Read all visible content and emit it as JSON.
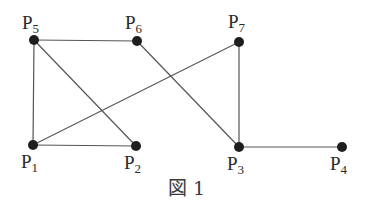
{
  "figure": {
    "caption": "図 1",
    "node_color": "#1e1e1e",
    "edge_color": "#555555"
  },
  "nodes": [
    {
      "id": "P1",
      "label": "P",
      "sub": "1",
      "x": 33,
      "y": 145
    },
    {
      "id": "P2",
      "label": "P",
      "sub": "2",
      "x": 136,
      "y": 146
    },
    {
      "id": "P3",
      "label": "P",
      "sub": "3",
      "x": 239,
      "y": 147
    },
    {
      "id": "P4",
      "label": "P",
      "sub": "4",
      "x": 342,
      "y": 147
    },
    {
      "id": "P5",
      "label": "P",
      "sub": "5",
      "x": 34,
      "y": 40
    },
    {
      "id": "P6",
      "label": "P",
      "sub": "6",
      "x": 137,
      "y": 41
    },
    {
      "id": "P7",
      "label": "P",
      "sub": "7",
      "x": 239,
      "y": 42
    }
  ],
  "edges": [
    [
      "P5",
      "P6"
    ],
    [
      "P5",
      "P1"
    ],
    [
      "P5",
      "P2"
    ],
    [
      "P1",
      "P2"
    ],
    [
      "P1",
      "P7"
    ],
    [
      "P6",
      "P3"
    ],
    [
      "P7",
      "P3"
    ],
    [
      "P3",
      "P4"
    ]
  ]
}
